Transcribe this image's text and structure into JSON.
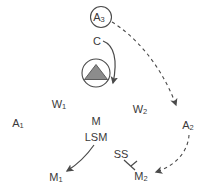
{
  "diagram": {
    "background_color": "#ffffff",
    "stroke_color": "#4a4a4a",
    "text_color": "#3a3a3a",
    "triangle_fill": "#8c8c8c",
    "nodes": {
      "a3": {
        "label": "A",
        "sub": "3",
        "shape": "circle",
        "x": 101,
        "y": 17
      },
      "c": {
        "label": "C",
        "sub": "",
        "shape": "text",
        "x": 97,
        "y": 42
      },
      "gland": {
        "label": "",
        "sub": "",
        "shape": "circle-with-triangle",
        "x": 96,
        "y": 73
      },
      "a1": {
        "label": "A",
        "sub": "1",
        "shape": "text",
        "x": 18,
        "y": 124
      },
      "w1": {
        "label": "W",
        "sub": "1",
        "shape": "text",
        "x": 59,
        "y": 105
      },
      "w2": {
        "label": "W",
        "sub": "2",
        "shape": "text",
        "x": 140,
        "y": 110
      },
      "m": {
        "label": "M",
        "sub": "",
        "shape": "text",
        "x": 96,
        "y": 122
      },
      "lsm": {
        "label": "LSM",
        "sub": "",
        "shape": "text",
        "x": 96,
        "y": 138
      },
      "ss": {
        "label": "SS",
        "sub": "",
        "shape": "text",
        "x": 121,
        "y": 155
      },
      "a2": {
        "label": "A",
        "sub": "2",
        "shape": "text",
        "x": 188,
        "y": 126
      },
      "m1": {
        "label": "M",
        "sub": "1",
        "shape": "text",
        "x": 56,
        "y": 178
      },
      "m2": {
        "label": "M",
        "sub": "2",
        "shape": "text",
        "x": 141,
        "y": 177
      }
    },
    "edges": [
      {
        "name": "a3-to-a2",
        "style": "dashed",
        "arrow": "open",
        "from": "a3",
        "to": "a2"
      },
      {
        "name": "a2-to-m2",
        "style": "dashed",
        "arrow": "open",
        "from": "a2",
        "to": "m2"
      },
      {
        "name": "c-to-gland-output",
        "style": "solid",
        "arrow": "open",
        "from": "c",
        "to": "gland"
      },
      {
        "name": "lsm-to-m1",
        "style": "solid",
        "arrow": "open",
        "from": "lsm",
        "to": "m1"
      },
      {
        "name": "ss-to-m2",
        "style": "solid",
        "arrow": "bar",
        "from": "ss",
        "to": "m2"
      }
    ]
  }
}
